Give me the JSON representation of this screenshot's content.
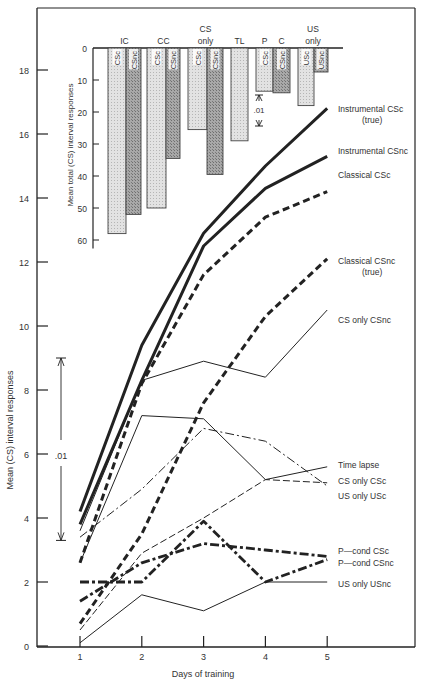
{
  "chart_data": [
    {
      "type": "line",
      "title": "",
      "xlabel": "Days of training",
      "ylabel": "Mean (CS) interval responses",
      "x": [
        1,
        2,
        3,
        4,
        5
      ],
      "xticks": [
        "1",
        "2",
        "3",
        "4",
        "5"
      ],
      "yticks": [
        0,
        2,
        4,
        6,
        8,
        10,
        12,
        14,
        16,
        18
      ],
      "ylim": [
        0,
        18.5
      ],
      "grid": false,
      "legend_position": "right, inline labels at line ends",
      "significance_bar": {
        "label": ".01",
        "from": 3.3,
        "to": 9.0
      },
      "series": [
        {
          "name": "Instrumental CSc (true)",
          "label_lines": [
            "Instrumental CSc",
            "(true)"
          ],
          "style": "heavy-solid",
          "values": [
            4.2,
            9.4,
            12.9,
            15.0,
            16.8
          ]
        },
        {
          "name": "Instrumental CSnc",
          "label_lines": [
            "Instrumental CSnc"
          ],
          "style": "heavy-solid",
          "values": [
            3.8,
            8.3,
            12.5,
            14.3,
            15.3
          ]
        },
        {
          "name": "Classical CSc",
          "label_lines": [
            "Classical CSc"
          ],
          "style": "heavy-dashed",
          "values": [
            2.6,
            8.2,
            11.6,
            13.4,
            14.2
          ]
        },
        {
          "name": "Classical CSnc (true)",
          "label_lines": [
            "Classical CSnc",
            "(true)"
          ],
          "style": "heavy-dashed",
          "values": [
            0.7,
            3.5,
            7.6,
            10.3,
            12.1
          ]
        },
        {
          "name": "CS only CSnc",
          "label_lines": [
            "CS only CSnc"
          ],
          "style": "thin-solid",
          "values": [
            3.6,
            8.3,
            8.9,
            8.4,
            10.5
          ]
        },
        {
          "name": "Time lapse",
          "label_lines": [
            "Time lapse"
          ],
          "style": "thin-solid",
          "values": [
            2.6,
            7.2,
            7.1,
            5.2,
            5.6
          ]
        },
        {
          "name": "CS only CSc",
          "label_lines": [
            "CS only CSc"
          ],
          "style": "thin-dashdot",
          "values": [
            3.4,
            4.9,
            6.8,
            6.4,
            5.0
          ]
        },
        {
          "name": "US only USc",
          "label_lines": [
            "US only USc"
          ],
          "style": "thin-dashed",
          "values": [
            0.5,
            2.9,
            4.0,
            5.2,
            5.1
          ]
        },
        {
          "name": "P-cond CSc",
          "label_lines": [
            "P—cond CSc"
          ],
          "style": "heavy-dashdot",
          "values": [
            1.4,
            2.6,
            3.2,
            3.0,
            2.8
          ]
        },
        {
          "name": "P-cond CSnc",
          "label_lines": [
            "P—cond CSnc"
          ],
          "style": "heavy-dashdot",
          "values": [
            2.0,
            2.0,
            3.9,
            2.0,
            2.7
          ]
        },
        {
          "name": "US only USnc",
          "label_lines": [
            "US only USnc"
          ],
          "style": "thin-solid",
          "values": [
            0.1,
            1.6,
            1.1,
            2.0,
            2.0
          ]
        }
      ]
    },
    {
      "type": "bar",
      "title": "",
      "inset": true,
      "orientation": "downward from 0",
      "ylabel": "Mean total (CS) interval responses",
      "yticks": [
        0,
        10,
        20,
        30,
        40,
        50,
        60
      ],
      "ylim": [
        0,
        62
      ],
      "significance_bar": {
        "label": ".01"
      },
      "groups": [
        {
          "label": "IC",
          "bars": [
            {
              "label": "CSc",
              "value": 58,
              "shade": "light"
            },
            {
              "label": "CSnc",
              "value": 52,
              "shade": "dark"
            }
          ]
        },
        {
          "label": "CC",
          "bars": [
            {
              "label": "CSc",
              "value": 50,
              "shade": "light"
            },
            {
              "label": "CSnc",
              "value": 34.5,
              "shade": "dark"
            }
          ]
        },
        {
          "label": "CS only",
          "label_lines": [
            "CS",
            "only"
          ],
          "bars": [
            {
              "label": "CSc",
              "value": 25.5,
              "shade": "light"
            },
            {
              "label": "CSnc",
              "value": 39.5,
              "shade": "dark"
            }
          ]
        },
        {
          "label": "TL",
          "bars": [
            {
              "label": "",
              "value": 29,
              "shade": "light"
            }
          ]
        },
        {
          "label": "P",
          "bars": [
            {
              "label": "CSc",
              "value": 13.5,
              "shade": "light"
            }
          ]
        },
        {
          "label": "C",
          "bars": [
            {
              "label": "CSnc",
              "value": 14,
              "shade": "dark"
            }
          ]
        },
        {
          "label": "US only",
          "label_lines": [
            "US",
            "only"
          ],
          "bars": [
            {
              "label": "USc",
              "value": 18,
              "shade": "light"
            },
            {
              "label": "USnc",
              "value": 7.5,
              "shade": "dark"
            }
          ]
        }
      ]
    }
  ],
  "colors": {
    "ink": "#222222",
    "text": "#333333",
    "bar_light": "#d9d9d9",
    "bar_dark": "#9a9a9a",
    "background": "#ffffff"
  }
}
